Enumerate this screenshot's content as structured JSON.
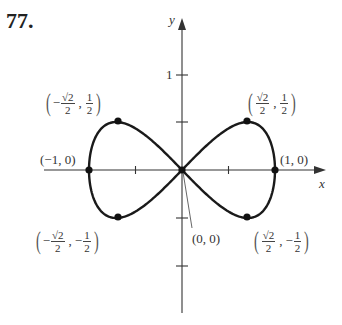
{
  "problem_number": "77.",
  "chart_data": {
    "type": "line",
    "title": "",
    "xlabel": "x",
    "ylabel": "y",
    "curve": "figure-eight (lemniscate of Gerono): y = ± x·sqrt(1 − x²)",
    "xlim": [
      -1,
      1
    ],
    "ylim": [
      -1,
      1
    ],
    "x_ticks": [
      -0.5,
      0.5
    ],
    "y_ticks": [
      1,
      0.5,
      -0.5,
      -1
    ],
    "y_tick_labels": [
      "1"
    ],
    "grid": false,
    "points": [
      {
        "label": "(−1, 0)",
        "x": -1,
        "y": 0
      },
      {
        "label": "(1, 0)",
        "x": 1,
        "y": 0
      },
      {
        "label": "(0, 0)",
        "x": 0,
        "y": 0
      },
      {
        "label": "(−√2/2, 1/2)",
        "x": -0.7071,
        "y": 0.5
      },
      {
        "label": "(√2/2, 1/2)",
        "x": 0.7071,
        "y": 0.5
      },
      {
        "label": "(−√2/2, −1/2)",
        "x": -0.7071,
        "y": -0.5
      },
      {
        "label": "(√2/2, −1/2)",
        "x": 0.7071,
        "y": -0.5
      }
    ]
  },
  "labels": {
    "x_axis": "x",
    "y_axis": "y",
    "y_tick_1": "1",
    "neg1_0": "(−1, 0)",
    "pos1_0": "(1, 0)",
    "origin": "(0, 0)",
    "sqrt2": "√2",
    "two": "2",
    "one": "1",
    "neg": "−",
    "comma": ","
  }
}
